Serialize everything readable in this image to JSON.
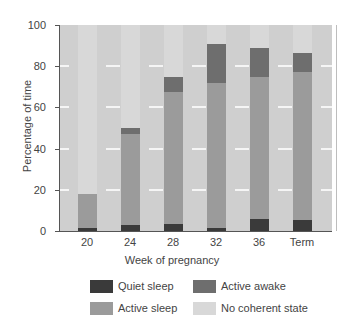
{
  "chart_data": {
    "type": "bar",
    "stacked": true,
    "title": "",
    "xlabel": "Week of pregnancy",
    "ylabel": "Percentage of time",
    "ylim": [
      0,
      100
    ],
    "yticks": [
      0,
      20,
      40,
      60,
      80,
      100
    ],
    "grid": "horizontal white lines at 20, 40, 60, 80 (between bars)",
    "legend_position": "bottom",
    "categories": [
      "20",
      "24",
      "28",
      "32",
      "36",
      "Term"
    ],
    "series": [
      {
        "name": "Quiet sleep",
        "color": "#3a3a3a",
        "values": [
          1.5,
          3,
          3.5,
          1.5,
          6,
          5.5
        ]
      },
      {
        "name": "Active sleep",
        "color": "#9b9b9b",
        "values": [
          16.5,
          44,
          64,
          70.5,
          69,
          71.5
        ]
      },
      {
        "name": "Active awake",
        "color": "#6e6e6e",
        "values": [
          0,
          3,
          7.5,
          19,
          14,
          9.5
        ]
      },
      {
        "name": "No coherent state",
        "color": "#d8d8d8",
        "values": [
          82,
          50,
          25,
          9,
          11,
          13.5
        ]
      }
    ]
  },
  "axis": {
    "ylabel": "Percentage of time",
    "xlabel": "Week of pregnancy",
    "yticks": [
      "0",
      "20",
      "40",
      "60",
      "80",
      "100"
    ],
    "xticks": [
      "20",
      "24",
      "28",
      "32",
      "36",
      "Term"
    ]
  },
  "legend": {
    "items": [
      {
        "label": "Quiet sleep",
        "color": "#3a3a3a"
      },
      {
        "label": "Active awake",
        "color": "#6e6e6e"
      },
      {
        "label": "Active sleep",
        "color": "#9b9b9b"
      },
      {
        "label": "No coherent state",
        "color": "#d8d8d8"
      }
    ]
  }
}
